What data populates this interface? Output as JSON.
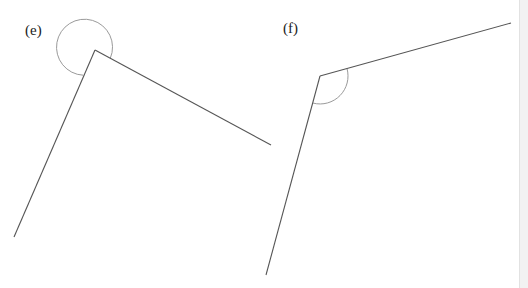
{
  "figures": [
    {
      "label": "(e)",
      "vertex": [
        95,
        50
      ],
      "arm1_end": [
        271,
        145
      ],
      "arm2_end": [
        14,
        237
      ],
      "angle_marker": "reflex-circle",
      "marker_radius": 28
    },
    {
      "label": "(f)",
      "vertex": [
        320,
        76
      ],
      "arm1_end": [
        511,
        23
      ],
      "arm2_end": [
        266,
        275
      ],
      "angle_marker": "obtuse-arc",
      "marker_radius": 28
    }
  ],
  "colors": {
    "line": "#555555",
    "marker": "#9a9a9a",
    "background": "#ffffff"
  }
}
